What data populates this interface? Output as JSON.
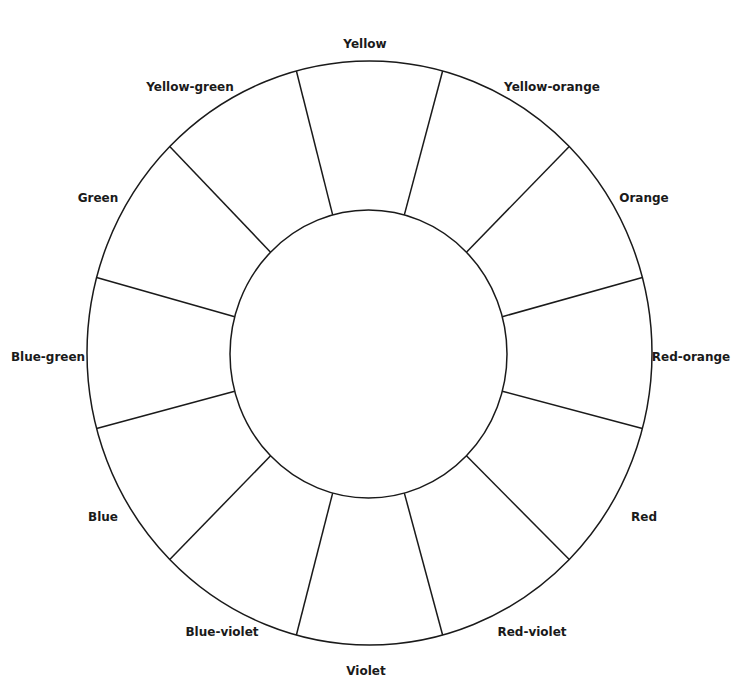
{
  "diagram": {
    "type": "color-wheel-worksheet",
    "segment_count": 12,
    "labels": [
      {
        "name": "Yellow"
      },
      {
        "name": "Yellow-orange"
      },
      {
        "name": "Orange"
      },
      {
        "name": "Red-orange"
      },
      {
        "name": "Red"
      },
      {
        "name": "Red-violet"
      },
      {
        "name": "Violet"
      },
      {
        "name": "Blue-violet"
      },
      {
        "name": "Blue"
      },
      {
        "name": "Blue-green"
      },
      {
        "name": "Green"
      },
      {
        "name": "Yellow-green"
      }
    ],
    "line_color": "#1a1a1a",
    "fill_color": "#ffffff"
  }
}
